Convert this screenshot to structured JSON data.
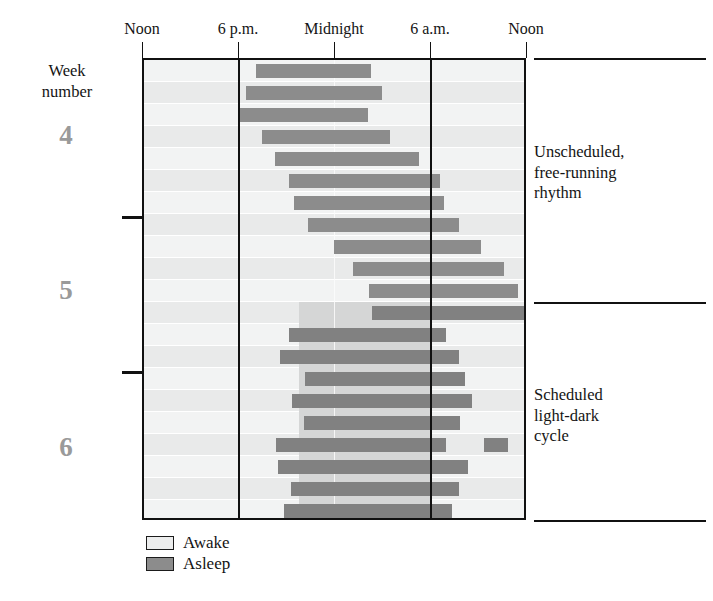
{
  "figure": {
    "type": "actogram",
    "plot": {
      "x": 142,
      "y": 58,
      "width": 384,
      "height": 462
    },
    "rows": 21,
    "row_height": 22
  },
  "axis": {
    "title": "",
    "ticks": [
      {
        "label": "Noon",
        "x": 142,
        "hour": 12
      },
      {
        "label": "6 p.m.",
        "x": 238,
        "hour": 18
      },
      {
        "label": "Midnight",
        "x": 334,
        "hour": 24
      },
      {
        "label": "6 a.m.",
        "x": 430,
        "hour": 30
      },
      {
        "label": "Noon",
        "x": 526,
        "hour": 36
      }
    ],
    "hour_start": 12,
    "hour_end": 36,
    "gridlines": [
      18,
      30
    ],
    "midline_hour": 24
  },
  "left_axis": {
    "caption_line1": "Week",
    "caption_line2": "number",
    "weeks": [
      {
        "label": "4",
        "center_y": 135
      },
      {
        "label": "5",
        "center_y": 290
      },
      {
        "label": "6",
        "center_y": 447
      }
    ],
    "ticks_y": [
      216,
      371
    ]
  },
  "annotations": [
    {
      "text": "Unscheduled,\nfree-running\nrhythm",
      "x": 534,
      "y": 142
    },
    {
      "text": "Scheduled\nlight-dark\ncycle",
      "x": 534,
      "y": 385
    }
  ],
  "rules": [
    {
      "x": 534,
      "y": 58,
      "width": 172
    },
    {
      "x": 534,
      "y": 302,
      "width": 172
    },
    {
      "x": 534,
      "y": 520,
      "width": 172
    }
  ],
  "legend": {
    "position": "bottom-left",
    "items": [
      {
        "label": "Awake",
        "color": "#eceded"
      },
      {
        "label": "Asleep",
        "color": "#8c8c8c"
      }
    ]
  },
  "colors": {
    "asleep": "#8c8c8c",
    "awake": "#eceded",
    "dark_phase_band": "#d5d6d6",
    "axis": "#111111",
    "week_number": "#9a9a9a",
    "text": "#141414",
    "background": "#ffffff"
  },
  "light_dark_schedule": {
    "applies_from_row": 12,
    "dark_start_hour": 21,
    "dark_end_hour": 30,
    "band_x": 299,
    "band_width": 131
  },
  "chart_data": {
    "type": "bar",
    "title": "",
    "xlabel": "Time of day",
    "ylabel": "Week number",
    "xlim": [
      12,
      36
    ],
    "ylim": [
      0,
      21
    ],
    "grid": true,
    "legend_position": "bottom-left",
    "x_tick_labels": [
      "Noon",
      "6 p.m.",
      "Midnight",
      "6 a.m.",
      "Noon"
    ],
    "x_tick_hours": [
      12,
      18,
      24,
      30,
      36
    ],
    "series": [
      {
        "name": "Awake",
        "color": "#eceded"
      },
      {
        "name": "Asleep",
        "color": "#8c8c8c"
      }
    ],
    "note": "Each row is one day; horizontal dark bars mark the asleep interval in hours since the preceding noon.",
    "sleep_bouts": [
      {
        "day": 1,
        "segments": [
          [
            19.1,
            26.3
          ]
        ]
      },
      {
        "day": 2,
        "segments": [
          [
            18.5,
            27.0
          ]
        ]
      },
      {
        "day": 3,
        "segments": [
          [
            18.1,
            26.1
          ]
        ]
      },
      {
        "day": 4,
        "segments": [
          [
            19.5,
            27.5
          ]
        ]
      },
      {
        "day": 5,
        "segments": [
          [
            20.3,
            29.3
          ]
        ]
      },
      {
        "day": 6,
        "segments": [
          [
            21.2,
            30.6
          ]
        ]
      },
      {
        "day": 7,
        "segments": [
          [
            21.5,
            30.9
          ]
        ]
      },
      {
        "day": 8,
        "segments": [
          [
            22.4,
            31.8
          ]
        ]
      },
      {
        "day": 9,
        "segments": [
          [
            24.0,
            33.2
          ]
        ]
      },
      {
        "day": 10,
        "segments": [
          [
            25.2,
            34.6
          ]
        ]
      },
      {
        "day": 11,
        "segments": [
          [
            26.2,
            35.5
          ]
        ]
      },
      {
        "day": 12,
        "segments": [
          [
            26.4,
            36.0
          ]
        ]
      },
      {
        "day": 13,
        "segments": [
          [
            21.2,
            31.0
          ]
        ]
      },
      {
        "day": 14,
        "segments": [
          [
            20.6,
            31.8
          ]
        ]
      },
      {
        "day": 15,
        "segments": [
          [
            22.2,
            32.2
          ]
        ]
      },
      {
        "day": 16,
        "segments": [
          [
            21.4,
            32.6
          ]
        ]
      },
      {
        "day": 17,
        "segments": [
          [
            22.1,
            31.9
          ]
        ]
      },
      {
        "day": 18,
        "segments": [
          [
            20.4,
            31.0
          ],
          [
            33.4,
            34.9
          ]
        ]
      },
      {
        "day": 19,
        "segments": [
          [
            20.5,
            32.4
          ]
        ]
      },
      {
        "day": 20,
        "segments": [
          [
            21.3,
            31.8
          ]
        ]
      },
      {
        "day": 21,
        "segments": [
          [
            20.9,
            31.4
          ]
        ]
      }
    ]
  }
}
